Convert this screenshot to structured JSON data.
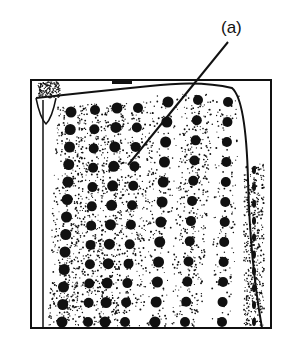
{
  "figure": {
    "label": "(a)",
    "label_pos": [
      221,
      18
    ],
    "leader_line": {
      "from": [
        228,
        42
      ],
      "to": [
        128,
        165
      ]
    },
    "frame": {
      "x": 31,
      "y": 80,
      "w": 240,
      "h": 248
    },
    "ink": "#111111",
    "columns": [
      {
        "x0": 71,
        "x1": 62,
        "y0": 112,
        "y1": 322,
        "n": 13,
        "r": 5.5,
        "band": 10
      },
      {
        "x0": 95,
        "x1": 88,
        "y0": 110,
        "y1": 322,
        "n": 12,
        "r": 5,
        "band": 12
      },
      {
        "x0": 117,
        "x1": 105,
        "y0": 108,
        "y1": 322,
        "n": 12,
        "r": 5.5,
        "band": 0
      },
      {
        "x0": 138,
        "x1": 125,
        "y0": 108,
        "y1": 322,
        "n": 12,
        "r": 5,
        "band": 14
      },
      {
        "x0": 168,
        "x1": 155,
        "y0": 102,
        "y1": 322,
        "n": 12,
        "r": 5.5,
        "band": 0
      },
      {
        "x0": 198,
        "x1": 185,
        "y0": 100,
        "y1": 322,
        "n": 12,
        "r": 5,
        "band": 12
      },
      {
        "x0": 228,
        "x1": 222,
        "y0": 102,
        "y1": 322,
        "n": 12,
        "r": 5,
        "band": 0
      },
      {
        "x0": 254,
        "x1": 254,
        "y0": 170,
        "y1": 322,
        "n": 10,
        "r": 3,
        "band": 6
      }
    ]
  }
}
